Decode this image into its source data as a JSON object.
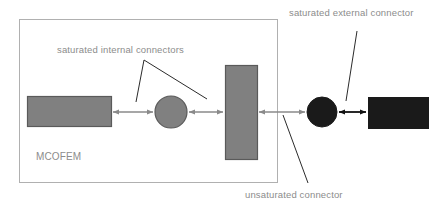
{
  "diagram": {
    "canvas": {
      "width": 441,
      "height": 207,
      "background": "#ffffff"
    },
    "labels": {
      "system": "MCOFEM",
      "internal_connectors": "saturated internal connectors",
      "external_connector": "saturated external connector",
      "unsaturated_connector": "unsaturated connector"
    },
    "colors": {
      "background": "#ffffff",
      "boundary_stroke": "#b0b0b0",
      "gray_fill": "#808080",
      "gray_stroke": "#5a5a5a",
      "black_fill": "#1a1a1a",
      "gray_arrow": "#8a8a8a",
      "black_arrow": "#111111",
      "label_text": "#8c8c8c",
      "leader_line": "#2b2b2b"
    },
    "boundary": {
      "name": "MCOFEM system boundary",
      "x": 19,
      "y": 19,
      "width": 258,
      "height": 163
    },
    "nodes": [
      {
        "id": "left-rect",
        "shape": "rect",
        "fill": "gray",
        "x": 27,
        "y": 96,
        "width": 84,
        "height": 30
      },
      {
        "id": "gray-circle",
        "shape": "circle",
        "fill": "gray",
        "cx": 171,
        "cy": 112,
        "r": 16
      },
      {
        "id": "tall-rect",
        "shape": "rect",
        "fill": "gray",
        "x": 225,
        "y": 65,
        "width": 32,
        "height": 94
      },
      {
        "id": "black-circle",
        "shape": "circle",
        "fill": "black",
        "cx": 322,
        "cy": 112,
        "r": 15
      },
      {
        "id": "black-rect",
        "shape": "rect",
        "fill": "black",
        "x": 368,
        "y": 97,
        "width": 60,
        "height": 31
      }
    ],
    "connectors": [
      {
        "id": "conn-1",
        "kind": "saturated-internal",
        "color": "gray",
        "x1": 113,
        "x2": 153,
        "y": 112
      },
      {
        "id": "conn-2",
        "kind": "saturated-internal",
        "color": "gray",
        "x1": 189,
        "x2": 223,
        "y": 112
      },
      {
        "id": "conn-3",
        "kind": "unsaturated",
        "color": "gray",
        "x1": 259,
        "x2": 305,
        "y": 112
      },
      {
        "id": "conn-4",
        "kind": "saturated-external",
        "color": "black",
        "x1": 339,
        "x2": 366,
        "y": 112
      }
    ],
    "leaders": [
      {
        "id": "leader-internal-left",
        "x1": 144,
        "y1": 60,
        "x2": 136,
        "y2": 102
      },
      {
        "id": "leader-internal-right",
        "x1": 144,
        "y1": 60,
        "x2": 207,
        "y2": 99
      },
      {
        "id": "leader-external",
        "x1": 357,
        "y1": 31,
        "x2": 346,
        "y2": 101
      },
      {
        "id": "leader-unsaturated",
        "x1": 283,
        "y1": 115,
        "x2": 308,
        "y2": 183
      }
    ],
    "label_positions": {
      "system": {
        "x": 36,
        "y": 160,
        "anchor": "start"
      },
      "internal_connectors": {
        "x": 57,
        "y": 53,
        "anchor": "start"
      },
      "external_connector": {
        "x": 289,
        "y": 16,
        "anchor": "start"
      },
      "unsaturated_connector": {
        "x": 245,
        "y": 198,
        "anchor": "start"
      }
    }
  }
}
